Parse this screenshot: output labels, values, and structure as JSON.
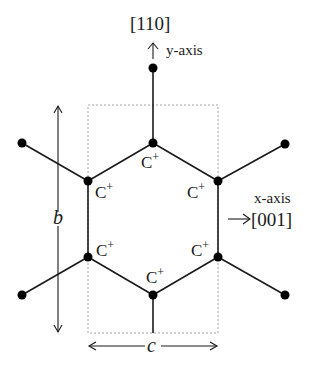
{
  "figure": {
    "colors": {
      "line": "#1a1a1a",
      "atom": "#000000",
      "cell": "#9a9a9a",
      "background": "#ffffff"
    }
  },
  "axes": {
    "y_direction": "[110]",
    "y_label": "y-axis",
    "x_label": "x-axis",
    "x_direction": "[001]"
  },
  "dimensions": {
    "b_label": "b",
    "c_label": "c"
  },
  "ring": {
    "atom_label": "C",
    "charge": "+",
    "atoms": [
      {
        "id": "top"
      },
      {
        "id": "upper-left"
      },
      {
        "id": "upper-right"
      },
      {
        "id": "lower-left"
      },
      {
        "id": "lower-right"
      },
      {
        "id": "bottom"
      }
    ]
  }
}
